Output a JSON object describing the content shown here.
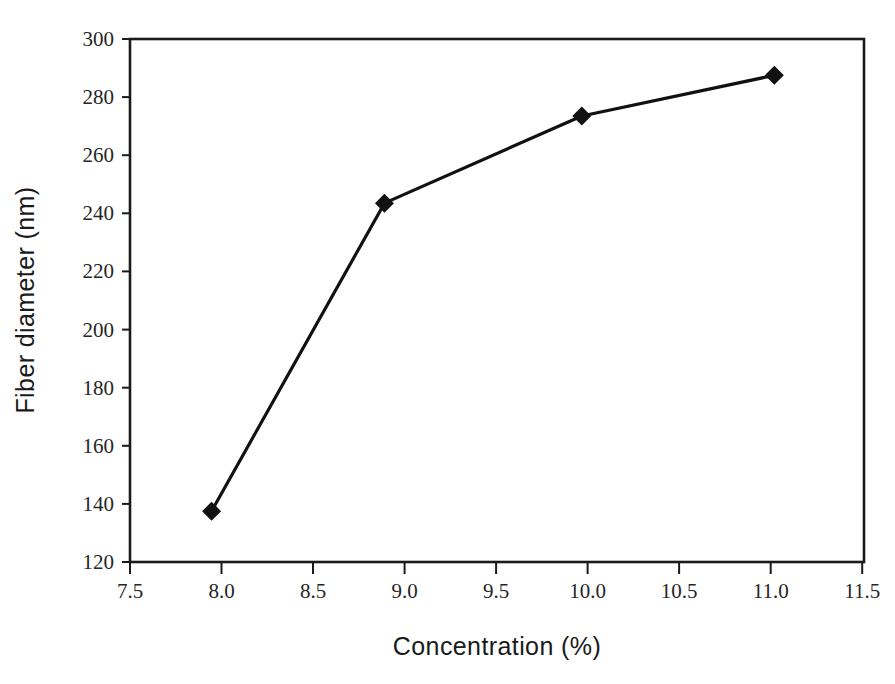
{
  "chart_data": {
    "type": "line",
    "title": "",
    "subtitle": "",
    "xlabel": "Concentration (%)",
    "ylabel": "Fiber diameter (nm)",
    "xlim": [
      7.5,
      12.0
    ],
    "ylim": [
      120,
      300
    ],
    "xticks": [
      "7.5",
      "8.0",
      "8.5",
      "9.0",
      "9.5",
      "10.0",
      "10.5",
      "11.0",
      "11.5"
    ],
    "xtick_values": [
      7.5,
      8.0,
      8.5,
      9.0,
      9.5,
      10.0,
      10.5,
      11.0,
      11.5
    ],
    "yticks": [
      "120",
      "140",
      "160",
      "180",
      "200",
      "220",
      "240",
      "260",
      "280",
      "300"
    ],
    "ytick_values": [
      120,
      140,
      160,
      180,
      200,
      220,
      240,
      260,
      280,
      300
    ],
    "grid": false,
    "legend": false,
    "legend_position": "none",
    "marker": "diamond",
    "series": [
      {
        "name": "Fiber diameter",
        "color": "#111111",
        "x": [
          8.0,
          9.06,
          10.27,
          11.45
        ],
        "values": [
          137.5,
          243.5,
          273.5,
          287.5
        ],
        "points": [
          {
            "x": 8.0,
            "y": 137.5
          },
          {
            "x": 9.06,
            "y": 243.5
          },
          {
            "x": 10.27,
            "y": 273.5
          },
          {
            "x": 11.45,
            "y": 287.5
          }
        ]
      }
    ]
  },
  "colors": {
    "line": "#111111",
    "marker": "#111111",
    "axis": "#1a1a1a",
    "tick_text": "#262626",
    "title_text": "#1a1a1a",
    "background": "#ffffff"
  },
  "axes": {
    "x_axis_label": "Concentration (%)",
    "y_axis_label": "Fiber diameter (nm)"
  }
}
